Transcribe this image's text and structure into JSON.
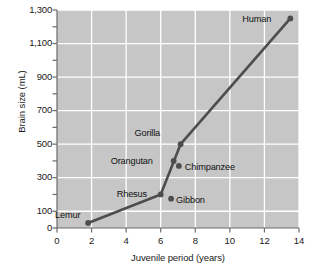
{
  "chart_data": {
    "type": "scatter",
    "title": "",
    "xlabel": "Juvenile period (years)",
    "ylabel": "Brain size (mL)",
    "xlim": [
      0,
      14
    ],
    "ylim": [
      0,
      1300
    ],
    "xticks": [
      0,
      2,
      4,
      6,
      8,
      10,
      12,
      14
    ],
    "xtick_labels": [
      "0",
      "2",
      "4",
      "6",
      "8",
      "10",
      "12",
      "14"
    ],
    "yticks": [
      0,
      100,
      300,
      500,
      700,
      900,
      1100,
      1300
    ],
    "ytick_labels": [
      "0",
      "100",
      "300",
      "500",
      "700",
      "900",
      "1,100",
      "1,300"
    ],
    "y_minor_ticks": [
      200,
      400,
      600,
      800,
      1000,
      1200
    ],
    "grid": true,
    "grid_color": "#ffffff",
    "plot_background": "#c6c6c6",
    "series_color": "#4d4d4d",
    "legend": null,
    "points": [
      {
        "label": "Lemur",
        "x": 1.8,
        "y": 30,
        "label_dx": -33,
        "label_dy": -13
      },
      {
        "label": "Rhesus",
        "x": 6.0,
        "y": 200,
        "label_dx": -44,
        "label_dy": -5
      },
      {
        "label": "Gibbon",
        "x": 6.6,
        "y": 175,
        "label_dx": 5,
        "label_dy": -4
      },
      {
        "label": "Orangutan",
        "x": 6.75,
        "y": 400,
        "label_dx": -63,
        "label_dy": -5
      },
      {
        "label": "Chimpanzee",
        "x": 7.05,
        "y": 370,
        "label_dx": 6,
        "label_dy": -4
      },
      {
        "label": "Gorilla",
        "x": 7.15,
        "y": 500,
        "label_dx": -46,
        "label_dy": -16
      },
      {
        "label": "Human",
        "x": 13.5,
        "y": 1250,
        "label_dx": -48,
        "label_dy": -4
      }
    ],
    "line_path_order": [
      "Lemur",
      "Rhesus",
      "Gorilla",
      "Human"
    ],
    "annotations": []
  }
}
